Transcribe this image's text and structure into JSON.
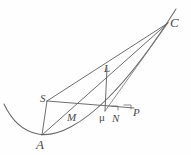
{
  "figure": {
    "background_color": "#fefefe",
    "stroke_color": "#6b6b6b",
    "label_color": "#4a4a4a",
    "width": 191,
    "height": 155,
    "points": [
      {
        "id": "A",
        "label": "A",
        "x": 42,
        "y": 135,
        "label_x": 38,
        "label_y": 139
      },
      {
        "id": "S",
        "label": "S",
        "x": 47,
        "y": 101,
        "label_x": 41,
        "label_y": 95
      },
      {
        "id": "M",
        "label": "M",
        "x": 73,
        "y": 111,
        "label_x": 68,
        "label_y": 113
      },
      {
        "id": "mu",
        "label": "μ",
        "x": 105,
        "y": 111,
        "label_x": 100,
        "label_y": 113
      },
      {
        "id": "N",
        "label": "N",
        "x": 117,
        "y": 111,
        "label_x": 113,
        "label_y": 114
      },
      {
        "id": "P",
        "label": "P",
        "x": 134,
        "y": 108,
        "label_x": 133,
        "label_y": 108
      },
      {
        "id": "L",
        "label": "L",
        "x": 107,
        "y": 71,
        "label_x": 105,
        "label_y": 66
      },
      {
        "id": "C",
        "label": "C",
        "x": 168,
        "y": 23,
        "label_x": 170,
        "label_y": 19
      }
    ],
    "segments": [
      {
        "name": "A-C",
        "from": "A",
        "to": "C"
      },
      {
        "name": "S-C",
        "from": "S",
        "to": "C"
      },
      {
        "name": "mu-C",
        "from": "mu",
        "to": "C"
      },
      {
        "name": "A-S",
        "from": "A",
        "to": "S"
      },
      {
        "name": "S-P",
        "from": "S",
        "to": "P"
      },
      {
        "name": "mu-L",
        "from": "mu",
        "to": "L"
      }
    ],
    "curve": {
      "name": "parabola",
      "description": "parabola opening upward through A and C",
      "path": "M 4 104 C 11 119, 22 131, 38 134 C 58 138, 84 122, 108 98 C 132 74, 154 44, 176 9"
    },
    "ticks": [
      {
        "name": "tick-N",
        "x1": 111,
        "y1": 106,
        "x2": 118,
        "y2": 106
      },
      {
        "name": "tick-N2",
        "x1": 118,
        "y1": 106,
        "x2": 118,
        "y2": 110
      },
      {
        "name": "tick-P",
        "x1": 124,
        "y1": 105,
        "x2": 131,
        "y2": 105
      },
      {
        "name": "tick-P2",
        "x1": 131,
        "y1": 105,
        "x2": 131,
        "y2": 109
      }
    ]
  }
}
